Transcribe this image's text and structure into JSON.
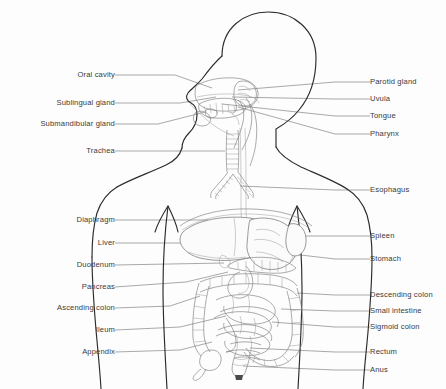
{
  "figure": {
    "background_color": "#fdfdfd",
    "line_color": "#2b2b2b",
    "organ_line_color": "#7d7d7d",
    "leader_line_color": "#6e6e6e",
    "label_text_color": "#3a3a3a"
  },
  "labels": {
    "left": [
      {
        "id": "oral-cavity",
        "text": "Oral cavity",
        "text_x": 115,
        "text_y": 75,
        "line": "115,75 175,75 212,88"
      },
      {
        "id": "sublingual-gland",
        "text": "Sublingual gland",
        "text_x": 115,
        "text_y": 103,
        "line": "115,103 180,103 216,97"
      },
      {
        "id": "submandibular-gland",
        "text": "Submandibular gland",
        "text_x": 115,
        "text_y": 124,
        "line": "115,124 158,124 205,112"
      },
      {
        "id": "trachea",
        "text": "Trachea",
        "text_x": 115,
        "text_y": 151,
        "line": "115,151 225,151"
      },
      {
        "id": "diaphragm",
        "text": "Diaphragm",
        "text_x": 115,
        "text_y": 220,
        "line": "115,220 208,220"
      },
      {
        "id": "liver",
        "text": "Liver",
        "text_x": 115,
        "text_y": 243,
        "line": "115,243 213,243"
      },
      {
        "id": "duodenum",
        "text": "Duodenum",
        "text_x": 115,
        "text_y": 265,
        "line": "115,265 224,263"
      },
      {
        "id": "pancreas",
        "text": "Pancreas",
        "text_x": 115,
        "text_y": 287,
        "line": "115,287 186,282 228,272"
      },
      {
        "id": "ascending-colon",
        "text": "Ascending colon",
        "text_x": 115,
        "text_y": 308,
        "line": "115,308 170,306 200,296"
      },
      {
        "id": "ileum",
        "text": "Ileum",
        "text_x": 115,
        "text_y": 330,
        "line": "115,330 180,327 226,316"
      },
      {
        "id": "appendix",
        "text": "Appendix",
        "text_x": 115,
        "text_y": 352,
        "line": "115,352 180,350 212,342"
      }
    ],
    "right": [
      {
        "id": "parotid-gland",
        "text": "Parotid gland",
        "text_x": 370,
        "text_y": 82,
        "line": "370,82 335,82 238,90"
      },
      {
        "id": "uvula",
        "text": "Uvula",
        "text_x": 370,
        "text_y": 99,
        "line": "370,99 335,99 232,97"
      },
      {
        "id": "tongue",
        "text": "Tongue",
        "text_x": 370,
        "text_y": 116,
        "line": "370,116 335,116 222,104"
      },
      {
        "id": "pharynx",
        "text": "Pharynx",
        "text_x": 370,
        "text_y": 134,
        "line": "370,134 335,134 238,107"
      },
      {
        "id": "esophagus",
        "text": "Esophagus",
        "text_x": 370,
        "text_y": 190,
        "line": "370,190 335,190 240,186"
      },
      {
        "id": "spleen",
        "text": "Spleen",
        "text_x": 370,
        "text_y": 236,
        "line": "370,236 335,236 300,236"
      },
      {
        "id": "stomach",
        "text": "Stomach",
        "text_x": 370,
        "text_y": 259,
        "line": "370,259 335,259 292,254 258,246"
      },
      {
        "id": "descending-colon",
        "text": "Descending colon",
        "text_x": 370,
        "text_y": 295,
        "line": "370,295 335,295 297,293"
      },
      {
        "id": "small-intestine",
        "text": "Small intestine",
        "text_x": 370,
        "text_y": 311,
        "line": "370,311 335,311 281,309"
      },
      {
        "id": "sigmoid-colon",
        "text": "Sigmoid colon",
        "text_x": 370,
        "text_y": 327,
        "line": "370,327 335,327 272,322"
      },
      {
        "id": "rectum",
        "text": "Rectum",
        "text_x": 370,
        "text_y": 352,
        "line": "370,352 335,352 250,348"
      },
      {
        "id": "anus",
        "text": "Anus",
        "text_x": 370,
        "text_y": 370,
        "line": "370,370 335,370 243,366"
      }
    ]
  },
  "anatomy": {
    "head_outline": "M 222,56 C 222,28 244,12 268,12 C 294,12 316,30 316,58 C 316,78 310,96 300,108 C 292,118 284,124 276,128 L 276,146",
    "face_profile": "M 222,56 C 214,62 208,72 202,80 C 197,86 192,90 189,94 C 186,98 188,102 192,104 C 196,106 198,110 198,116 C 198,124 194,130 190,134 C 186,138 182,142 182,148",
    "neck_left": "M 182,148 C 180,154 176,160 168,164 C 150,172 132,178 118,186",
    "neck_right": "M 276,146 C 280,154 288,160 300,166 C 318,174 334,180 346,188",
    "shoulder_left": "M 118,186 C 108,192 102,200 98,212 C 94,226 92,242 92,256",
    "shoulder_right": "M 346,188 C 356,194 362,202 366,214 C 370,228 372,244 372,258",
    "torso_left": "M 92,256 C 92,280 94,306 96,330 C 98,352 100,370 101,389",
    "torso_right": "M 372,258 C 372,282 370,308 368,332 C 366,354 364,372 363,389",
    "hip_left": "M 168,208 C 166,230 164,260 164,290 C 164,320 166,352 168,389",
    "hip_right": "M 296,208 C 298,230 300,260 300,290 C 300,320 298,352 296,389",
    "trachea_x": 232,
    "diaphragm": "M 196,222 C 216,210 250,206 278,210 C 296,213 308,220 314,228"
  }
}
